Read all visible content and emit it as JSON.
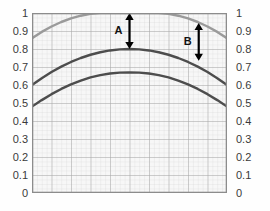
{
  "chart_data": {
    "type": "line",
    "title": "",
    "xlabel": "",
    "ylabel": "",
    "xlim": [
      0,
      1
    ],
    "ylim": [
      0,
      1
    ],
    "grid": true,
    "grid_major_step": 0.1,
    "grid_minor_step": 0.025,
    "legend": "none",
    "dual_y_axis": true,
    "y_ticks": [
      "1",
      "0.9",
      "0.8",
      "0.7",
      "0.6",
      "0.5",
      "0.4",
      "0.3",
      "0.2",
      "0.1",
      "0"
    ],
    "y_tick_values": [
      1,
      0.9,
      0.8,
      0.7,
      0.6,
      0.5,
      0.4,
      0.3,
      0.2,
      0.1,
      0
    ],
    "x_ticks_labeled": false,
    "series": [
      {
        "name": "upper-curve",
        "color": "#9a9a9a",
        "x": [
          0,
          0.05,
          0.1,
          0.15,
          0.2,
          0.25,
          0.3,
          0.35,
          0.4,
          0.45,
          0.5,
          0.55,
          0.6,
          0.65,
          0.7,
          0.75,
          0.8,
          0.85,
          0.9,
          0.95,
          1
        ],
        "values": [
          0.86,
          0.895,
          0.925,
          0.95,
          0.97,
          0.985,
          0.995,
          1.0,
          1.0,
          1.0,
          1.0,
          1.0,
          1.0,
          1.0,
          0.995,
          0.985,
          0.97,
          0.95,
          0.925,
          0.895,
          0.86
        ],
        "peak": 1.0,
        "endpoints": [
          0.86,
          0.86
        ]
      },
      {
        "name": "middle-curve",
        "color": "#4d4d4d",
        "x": [
          0,
          0.05,
          0.1,
          0.15,
          0.2,
          0.25,
          0.3,
          0.35,
          0.4,
          0.45,
          0.5,
          0.55,
          0.6,
          0.65,
          0.7,
          0.75,
          0.8,
          0.85,
          0.9,
          0.95,
          1
        ],
        "values": [
          0.6,
          0.638,
          0.672,
          0.702,
          0.728,
          0.75,
          0.768,
          0.782,
          0.792,
          0.798,
          0.8,
          0.798,
          0.792,
          0.782,
          0.768,
          0.75,
          0.728,
          0.702,
          0.672,
          0.638,
          0.6
        ],
        "peak": 0.8,
        "endpoints": [
          0.6,
          0.6
        ]
      },
      {
        "name": "lower-curve",
        "color": "#4d4d4d",
        "x": [
          0,
          0.05,
          0.1,
          0.15,
          0.2,
          0.25,
          0.3,
          0.35,
          0.4,
          0.45,
          0.5,
          0.55,
          0.6,
          0.65,
          0.7,
          0.75,
          0.8,
          0.85,
          0.9,
          0.95,
          1
        ],
        "values": [
          0.48,
          0.516,
          0.549,
          0.578,
          0.603,
          0.624,
          0.642,
          0.655,
          0.664,
          0.669,
          0.67,
          0.669,
          0.664,
          0.655,
          0.642,
          0.624,
          0.603,
          0.578,
          0.549,
          0.516,
          0.48
        ],
        "peak": 0.67,
        "endpoints": [
          0.48,
          0.48
        ]
      }
    ],
    "annotations": [
      {
        "label": "A",
        "type": "double-arrow-vertical",
        "x": 0.5,
        "y_top": 1.0,
        "y_bottom": 0.8,
        "label_side": "left",
        "color": "#000000"
      },
      {
        "label": "B",
        "type": "double-arrow-vertical",
        "x": 0.855,
        "y_top": 0.945,
        "y_bottom": 0.735,
        "label_side": "left",
        "color": "#000000"
      }
    ]
  },
  "axes": {
    "left": {
      "name": "left-y-axis",
      "ticks": [
        "1",
        "0.9",
        "0.8",
        "0.7",
        "0.6",
        "0.5",
        "0.4",
        "0.3",
        "0.2",
        "0.1",
        "0"
      ]
    },
    "right": {
      "name": "right-y-axis",
      "ticks": [
        "1",
        "0.9",
        "0.8",
        "0.7",
        "0.6",
        "0.5",
        "0.4",
        "0.3",
        "0.2",
        "0.1",
        "0"
      ]
    }
  },
  "colors": {
    "background": "#ffffff",
    "plot_background": "#f7f7f7",
    "grid_minor": "#dcdcdc",
    "grid_major": "#a8a8a8",
    "frame": "#8c8c8c",
    "curve_light": "#9a9a9a",
    "curve_dark": "#4d4d4d",
    "annotation": "#000000",
    "tick_text": "#3a3a3a"
  }
}
